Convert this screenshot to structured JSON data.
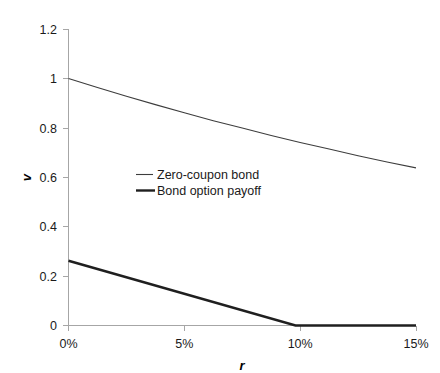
{
  "chart_data": {
    "type": "line",
    "title": "",
    "xlabel": "r",
    "ylabel": "v",
    "xlim": [
      0,
      0.15
    ],
    "ylim": [
      0,
      1.2
    ],
    "grid": false,
    "legend_position": "center-left-inside",
    "x_tick_labels": [
      "0%",
      "5%",
      "10%",
      "15%"
    ],
    "x_tick_values": [
      0,
      0.05,
      0.1,
      0.15
    ],
    "y_tick_labels": [
      "0",
      "0.2",
      "0.4",
      "0.6",
      "0.8",
      "1",
      "1.2"
    ],
    "y_tick_values": [
      0,
      0.2,
      0.4,
      0.6,
      0.8,
      1.0,
      1.2
    ],
    "x": [
      0,
      0.0125,
      0.025,
      0.0375,
      0.05,
      0.0625,
      0.075,
      0.0875,
      0.1,
      0.1125,
      0.125,
      0.1375,
      0.15
    ],
    "series": [
      {
        "name": "Zero-coupon bond",
        "style": "thin",
        "color": "#3d3d3d",
        "values": [
          1.0,
          0.963,
          0.928,
          0.894,
          0.861,
          0.829,
          0.799,
          0.769,
          0.741,
          0.714,
          0.687,
          0.662,
          0.638
        ]
      },
      {
        "name": "Bond option payoff",
        "style": "thick",
        "color": "#1f1f1f",
        "values": [
          0.262,
          0.229,
          0.195,
          0.162,
          0.128,
          0.095,
          0.062,
          0.028,
          0.0,
          0.0,
          0.0,
          0.0,
          0.0
        ]
      }
    ],
    "annotations": {
      "payoff_zero_crossing": 0.098
    }
  },
  "legend": {
    "entries": [
      {
        "label": "Zero-coupon bond"
      },
      {
        "label": "Bond option payoff"
      }
    ]
  },
  "axes": {
    "x_title": "r",
    "y_title": "v"
  }
}
